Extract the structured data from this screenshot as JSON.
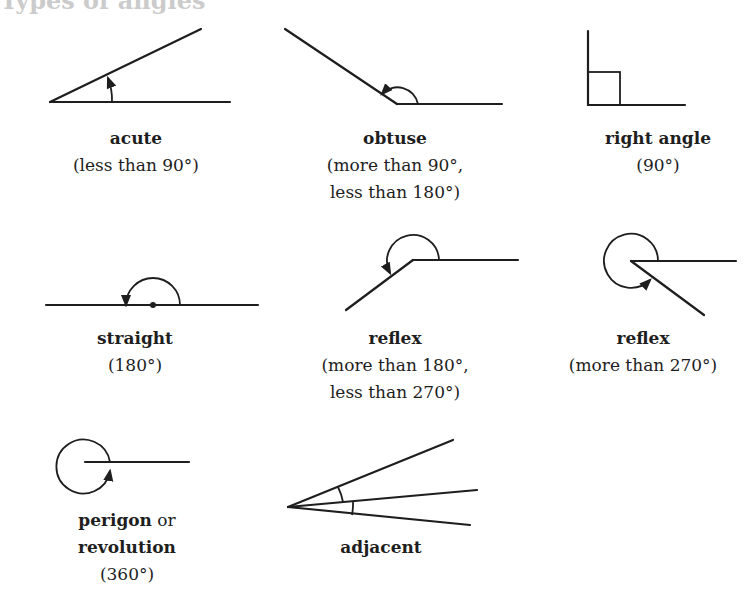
{
  "diagram": {
    "title": "Types of angles",
    "stroke_color": "#1e1e1e",
    "items": [
      {
        "id": "acute",
        "name": "acute",
        "lines": [
          "(less than 90°)"
        ],
        "label_x": 136,
        "label_y": 125,
        "rays": [
          [
            50,
            102,
            230,
            102
          ],
          [
            50,
            102,
            201,
            29
          ]
        ],
        "arcs": [
          {
            "d": "M 112 102 A 62 62 0 0 0 108 78",
            "arrow": "end"
          }
        ]
      },
      {
        "id": "obtuse",
        "name": "obtuse",
        "lines": [
          "(more than 90°,",
          "less than 180°)"
        ],
        "label_x": 395,
        "label_y": 125,
        "rays": [
          [
            397,
            104,
            502,
            104
          ],
          [
            397,
            104,
            285,
            29
          ]
        ],
        "arcs": [
          {
            "d": "M 418 104 A 21 21 0 0 0 382 94",
            "arrow": "end"
          }
        ]
      },
      {
        "id": "right",
        "name": "right angle",
        "lines": [
          "(90°)"
        ],
        "label_x": 658,
        "label_y": 125,
        "rays": [
          [
            588,
            105,
            685,
            105
          ],
          [
            588,
            105,
            588,
            31
          ]
        ],
        "square": [
          588,
          72,
          32,
          33
        ]
      },
      {
        "id": "straight",
        "name": "straight",
        "lines": [
          "(180°)"
        ],
        "label_x": 135,
        "label_y": 325,
        "rays": [
          [
            46,
            305,
            258,
            305
          ]
        ],
        "dot": [
          153,
          305
        ],
        "arcs": [
          {
            "d": "M 180 305 A 27 27 0 0 0 126 305",
            "arrow": "end"
          }
        ]
      },
      {
        "id": "reflex1",
        "name": "reflex",
        "lines": [
          "(more than 180°,",
          "less than 270°)"
        ],
        "label_x": 395,
        "label_y": 325,
        "rays": [
          [
            413,
            260,
            518,
            260
          ],
          [
            413,
            260,
            346,
            310
          ]
        ],
        "arcs": [
          {
            "d": "M 439 260 A 26 26 0 1 0 390 273",
            "arrow": "end"
          }
        ]
      },
      {
        "id": "reflex2",
        "name": "reflex",
        "lines": [
          "(more than 270°)"
        ],
        "label_x": 643,
        "label_y": 325,
        "rays": [
          [
            631,
            261,
            736,
            261
          ],
          [
            631,
            261,
            704,
            315
          ]
        ],
        "arcs": [
          {
            "d": "M 658 261 A 27 27 0 1 0 650 280",
            "arrow": "end"
          }
        ]
      },
      {
        "id": "perigon",
        "name": "perigon",
        "name_suffix": " or",
        "name2": "revolution",
        "lines": [
          "(360°)"
        ],
        "label_x": 127,
        "label_y": 507,
        "rays": [
          [
            85,
            462,
            189,
            462
          ]
        ],
        "arcs": [
          {
            "d": "M 110 462 A 27 27 0 1 0 110 471",
            "arrow": "end"
          }
        ]
      },
      {
        "id": "adjacent",
        "name": "adjacent",
        "lines": [],
        "label_x": 381,
        "label_y": 534,
        "rays": [
          [
            288,
            507,
            453,
            440
          ],
          [
            288,
            507,
            477,
            490
          ],
          [
            288,
            507,
            470,
            525
          ]
        ],
        "arcs": [
          {
            "d": "M 338 487 A 54 54 0 0 1 343 502"
          },
          {
            "d": "M 353 501 A 65 65 0 0 1 352 515"
          }
        ]
      }
    ]
  }
}
